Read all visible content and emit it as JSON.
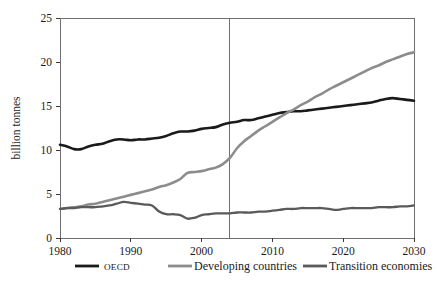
{
  "chart_data": {
    "type": "line",
    "title": "",
    "subtitle": "",
    "xlabel": "",
    "ylabel": "billion tonnes",
    "xlim": [
      1980,
      2030
    ],
    "ylim": [
      0,
      25
    ],
    "xticks": [
      "1980",
      "1990",
      "2000",
      "2010",
      "2020",
      "2030"
    ],
    "xtick_values": [
      1980,
      1990,
      2000,
      2010,
      2020,
      2030
    ],
    "yticks": [
      "0",
      "5",
      "10",
      "15",
      "20",
      "25"
    ],
    "ytick_values": [
      0,
      5,
      10,
      15,
      20,
      25
    ],
    "grid": false,
    "legend_position": "bottom",
    "annotations": [
      {
        "name": "history-projection-divider",
        "type": "vline",
        "x": 2004,
        "label": ""
      }
    ],
    "x": [
      1980,
      1981,
      1982,
      1983,
      1984,
      1985,
      1986,
      1987,
      1988,
      1989,
      1990,
      1991,
      1992,
      1993,
      1994,
      1995,
      1996,
      1997,
      1998,
      1999,
      2000,
      2001,
      2002,
      2003,
      2004,
      2005,
      2006,
      2007,
      2008,
      2009,
      2010,
      2011,
      2012,
      2013,
      2014,
      2015,
      2016,
      2017,
      2018,
      2019,
      2020,
      2021,
      2022,
      2023,
      2024,
      2025,
      2026,
      2027,
      2028,
      2029,
      2030
    ],
    "series": [
      {
        "name": "OECD",
        "color": "#1a1a1a",
        "width": 2.6,
        "values": [
          10.6,
          10.4,
          10.1,
          10.1,
          10.4,
          10.6,
          10.7,
          11.0,
          11.2,
          11.2,
          11.1,
          11.2,
          11.2,
          11.3,
          11.4,
          11.6,
          11.9,
          12.1,
          12.1,
          12.2,
          12.4,
          12.5,
          12.6,
          12.9,
          13.1,
          13.2,
          13.4,
          13.4,
          13.6,
          13.8,
          14.0,
          14.2,
          14.3,
          14.4,
          14.4,
          14.5,
          14.6,
          14.7,
          14.8,
          14.9,
          15.0,
          15.1,
          15.2,
          15.3,
          15.4,
          15.6,
          15.8,
          15.9,
          15.8,
          15.7,
          15.6
        ]
      },
      {
        "name": "Developing countries",
        "color": "#8c8c8c",
        "width": 2.6,
        "values": [
          3.3,
          3.4,
          3.5,
          3.6,
          3.8,
          3.9,
          4.1,
          4.3,
          4.5,
          4.7,
          4.9,
          5.1,
          5.3,
          5.5,
          5.8,
          6.0,
          6.3,
          6.7,
          7.4,
          7.5,
          7.6,
          7.8,
          8.0,
          8.4,
          9.1,
          10.2,
          11.0,
          11.6,
          12.2,
          12.7,
          13.2,
          13.7,
          14.2,
          14.6,
          15.1,
          15.5,
          16.0,
          16.4,
          16.9,
          17.3,
          17.7,
          18.1,
          18.5,
          18.9,
          19.3,
          19.6,
          20.0,
          20.3,
          20.6,
          20.9,
          21.1
        ]
      },
      {
        "name": "Transition economies",
        "color": "#5a5a5a",
        "width": 2.3,
        "values": [
          3.3,
          3.4,
          3.4,
          3.5,
          3.5,
          3.5,
          3.6,
          3.7,
          3.9,
          4.1,
          4.0,
          3.9,
          3.8,
          3.7,
          3.0,
          2.7,
          2.7,
          2.6,
          2.2,
          2.3,
          2.6,
          2.7,
          2.8,
          2.8,
          2.8,
          2.9,
          2.9,
          2.9,
          3.0,
          3.0,
          3.1,
          3.2,
          3.3,
          3.3,
          3.4,
          3.4,
          3.4,
          3.4,
          3.3,
          3.2,
          3.3,
          3.4,
          3.4,
          3.4,
          3.4,
          3.5,
          3.5,
          3.5,
          3.6,
          3.6,
          3.7
        ]
      }
    ],
    "legend": [
      {
        "label": "OECD",
        "color": "#1a1a1a",
        "style": "smallcaps"
      },
      {
        "label": "Developing countries",
        "color": "#8c8c8c",
        "style": "normal"
      },
      {
        "label": "Transition economies",
        "color": "#5a5a5a",
        "style": "normal"
      }
    ]
  }
}
